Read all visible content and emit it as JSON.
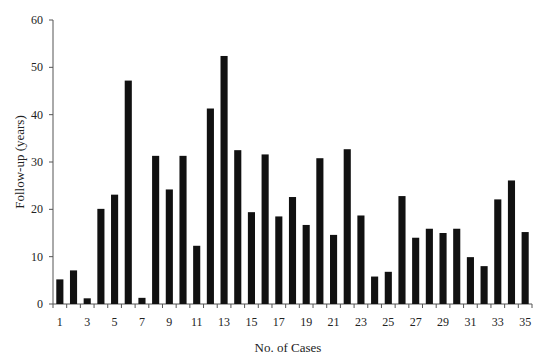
{
  "chart_data": {
    "type": "bar",
    "title": "",
    "xlabel": "No. of Cases",
    "ylabel": "Follow-up (years)",
    "ylim": [
      0,
      60
    ],
    "yticks": [
      0,
      10,
      20,
      30,
      40,
      50,
      60
    ],
    "xtick_labels": [
      "1",
      "3",
      "5",
      "7",
      "9",
      "11",
      "13",
      "15",
      "17",
      "19",
      "21",
      "23",
      "25",
      "27",
      "29",
      "31",
      "33",
      "35"
    ],
    "grid": false,
    "legend": null,
    "bar_color": "#111111",
    "categories": [
      1,
      2,
      3,
      4,
      5,
      6,
      7,
      8,
      9,
      10,
      11,
      12,
      13,
      14,
      15,
      16,
      17,
      18,
      19,
      20,
      21,
      22,
      23,
      24,
      25,
      26,
      27,
      28,
      29,
      30,
      31,
      32,
      33,
      34,
      35
    ],
    "values": [
      5.2,
      7.1,
      1.2,
      20.1,
      23.1,
      47.2,
      1.3,
      31.3,
      24.2,
      31.3,
      12.3,
      41.3,
      52.4,
      32.5,
      19.4,
      31.6,
      18.5,
      22.6,
      16.7,
      30.8,
      14.6,
      32.7,
      18.7,
      5.8,
      6.8,
      22.8,
      14.0,
      15.9,
      15.0,
      15.9,
      9.9,
      8.0,
      22.1,
      26.1,
      15.2
    ]
  }
}
